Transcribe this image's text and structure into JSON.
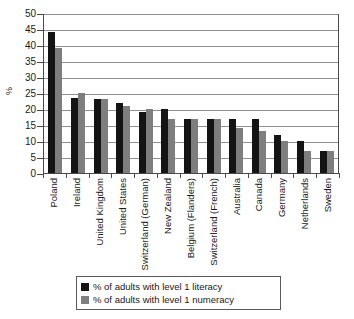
{
  "chart_data": {
    "type": "bar",
    "title": "",
    "xlabel": "",
    "ylabel": "%",
    "ylim": [
      0,
      50
    ],
    "ytick_step": 5,
    "yticks": [
      50,
      45,
      40,
      35,
      30,
      25,
      20,
      15,
      10,
      5,
      0
    ],
    "grid": true,
    "legend_position": "bottom",
    "categories": [
      "Poland",
      "Ireland",
      "United Kingdom",
      "United States",
      "Switzerland (German)",
      "New Zealand",
      "Belgium (Flanders)",
      "Switzerland (French)",
      "Australia",
      "Canada",
      "Germany",
      "Netherlands",
      "Sweden"
    ],
    "series": [
      {
        "name": "% of adults with level 1 literacy",
        "color": "#141414",
        "values": [
          44,
          23.5,
          23,
          22,
          19,
          20,
          17,
          17,
          17,
          17,
          12,
          10,
          7
        ]
      },
      {
        "name": "% of adults with level 1 numeracy",
        "color": "#7e7e7e",
        "values": [
          39,
          25,
          23,
          21,
          20,
          17,
          17,
          17,
          14,
          13,
          10,
          7,
          7
        ]
      }
    ]
  },
  "legend": {
    "items": [
      {
        "label": "% of adults with level 1 literacy",
        "swatch": "literacy"
      },
      {
        "label": "% of adults with level 1 numeracy",
        "swatch": "numeracy"
      }
    ]
  },
  "axes": {
    "y_title": "%"
  }
}
